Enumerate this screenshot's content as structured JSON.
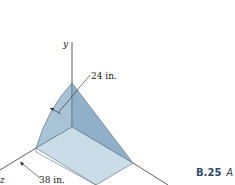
{
  "figure": {
    "id": "B.25",
    "caption_trailing": "A",
    "axes": {
      "y": "y",
      "z": "z",
      "x": ""
    },
    "dimensions": [
      {
        "label": "24 in.",
        "meaning": "radius of curved face"
      },
      {
        "label": "38 in.",
        "meaning": "length along z-axis"
      }
    ],
    "colors": {
      "solid_light": "#c9dce8",
      "solid_mid": "#a9c3d6",
      "solid_dark": "#8fb0c8",
      "edge": "#556b7d",
      "axis": "#333333",
      "caption": "#2c4a6e"
    }
  }
}
